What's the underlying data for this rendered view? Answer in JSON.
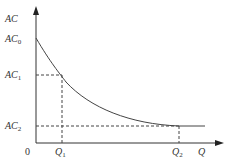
{
  "diagram": {
    "title": "",
    "axes": {
      "y_label": "AC",
      "x_label": "Q",
      "origin_label": "0"
    },
    "y_ticks": [
      {
        "base": "AC",
        "sub": "0"
      },
      {
        "base": "AC",
        "sub": "1"
      },
      {
        "base": "AC",
        "sub": "2"
      }
    ],
    "x_ticks": [
      {
        "base": "Q",
        "sub": "1"
      },
      {
        "base": "Q",
        "sub": "2"
      }
    ],
    "curve": "Average cost curve declining from AC0 to AC2 at Q2, then flat",
    "colors": {
      "line": "#333333",
      "dash": "#555555"
    }
  }
}
